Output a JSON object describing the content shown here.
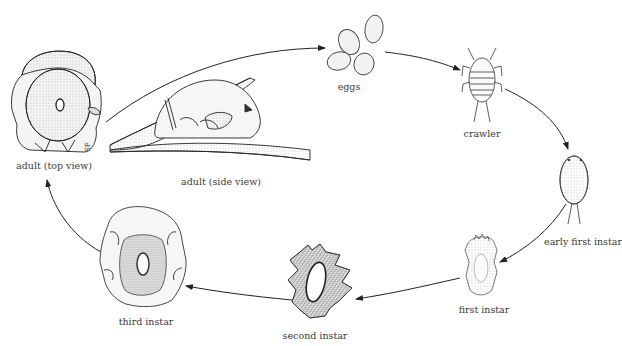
{
  "diagram": {
    "type": "life-cycle",
    "stages": [
      {
        "id": "adult-top",
        "label": "adult (top view)",
        "x": 54,
        "y": 162
      },
      {
        "id": "adult-side",
        "label": "adult (side view)",
        "x": 221,
        "y": 178
      },
      {
        "id": "eggs",
        "label": "eggs",
        "x": 349,
        "y": 87
      },
      {
        "id": "crawler",
        "label": "crawler",
        "x": 482,
        "y": 131
      },
      {
        "id": "early-first-instar",
        "label": "early first instar",
        "x": 583,
        "y": 240
      },
      {
        "id": "first-instar",
        "label": "first instar",
        "x": 484,
        "y": 306
      },
      {
        "id": "second-instar",
        "label": "second instar",
        "x": 315,
        "y": 332
      },
      {
        "id": "third-instar",
        "label": "third instar",
        "x": 146,
        "y": 318
      }
    ],
    "arrows": [
      {
        "from": "adult-top",
        "to": "eggs"
      },
      {
        "from": "eggs",
        "to": "crawler"
      },
      {
        "from": "crawler",
        "to": "early-first-instar"
      },
      {
        "from": "early-first-instar",
        "to": "first-instar"
      },
      {
        "from": "first-instar",
        "to": "second-instar"
      },
      {
        "from": "second-instar",
        "to": "third-instar"
      },
      {
        "from": "third-instar",
        "to": "adult-top"
      }
    ],
    "signature": "SF"
  }
}
